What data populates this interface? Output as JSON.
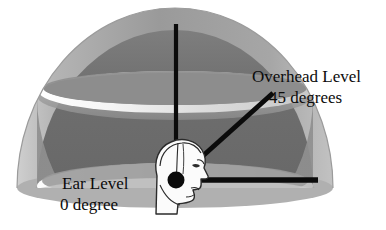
{
  "diagram": {
    "title_semantic": "spherical-speaker-array-elevation-diagram",
    "labels": {
      "overhead_level": "Overhead Level",
      "overhead_degrees": "45 degrees",
      "ear_level": "Ear Level",
      "ear_degrees": "0 degree"
    },
    "elements": {
      "dome": "hemisphere-shell",
      "head": "human-head-profile",
      "ear_marker": "ear-origin-dot",
      "vertical_axis": "zenith-axis-line",
      "diagonal_45": "45-degree-elevation-line",
      "horizontal_0": "0-degree-ear-level-line"
    },
    "colors": {
      "background": "#ffffff",
      "line": "#0b0b0b",
      "text": "#0b0b0b",
      "dome_outer_shell": "#a8a8a8",
      "dome_interior_upper": "#6f6f6f",
      "dome_interior_lower": "#8e8e8e",
      "ring_highlight": "#f2f2f2",
      "head_fill": "#fbfbfb",
      "head_outline": "#2a2a2a"
    },
    "geometry": {
      "dome_center_x": 175,
      "dome_base_y": 188,
      "dome_radius_x": 158,
      "dome_radius_y": 180,
      "vertical_line": {
        "x": 176,
        "y_top": 24,
        "y_bottom": 180
      },
      "diagonal_line": {
        "x1": 176,
        "y1": 180,
        "x2": 273,
        "y2": 93
      },
      "horizontal_line": {
        "x1": 176,
        "y1": 180,
        "x2": 318,
        "y2": 180
      },
      "ear_dot": {
        "cx": 176,
        "cy": 180,
        "r": 8
      },
      "ring_45_cy": 93,
      "ring_0_cy": 188
    }
  }
}
